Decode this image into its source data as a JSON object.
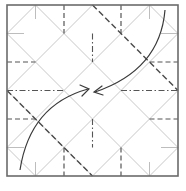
{
  "diagram": {
    "type": "origami-crease-pattern",
    "square": {
      "x": 7,
      "y": 5,
      "size": 171
    },
    "divisions": 6,
    "colors": {
      "border": "#6b6b6b",
      "grid": "#c8c8c8",
      "fold_lines": "#555555",
      "arrows": "#3a3a3a"
    },
    "line_styles": [
      "valley-fold-dashed",
      "mountain-fold-dash-dot",
      "reference-crease-thin"
    ],
    "arrows": [
      {
        "name": "arrow-top-right-to-center",
        "from": "top-right",
        "to": "center",
        "direction": "down-left"
      },
      {
        "name": "arrow-bottom-left-to-center",
        "from": "bottom-left",
        "to": "center",
        "direction": "up-right"
      }
    ]
  }
}
